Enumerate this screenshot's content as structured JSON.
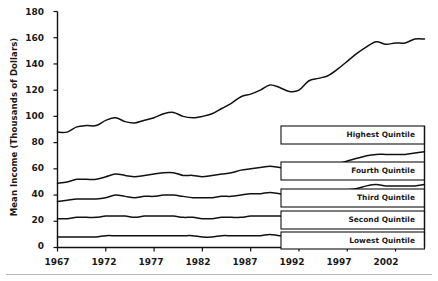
{
  "chart_data": {
    "type": "line",
    "title": "",
    "xlabel": "",
    "ylabel": "Mean Income (Thousands of Dollars)",
    "xlim": [
      1967,
      2005
    ],
    "ylim": [
      0,
      180
    ],
    "yticks": [
      0,
      20,
      40,
      60,
      80,
      100,
      120,
      140,
      160,
      180
    ],
    "xticks": [
      1967,
      1972,
      1977,
      1982,
      1987,
      1992,
      1997,
      2002
    ],
    "grid": false,
    "legend_position": "inline-right",
    "x": [
      1967,
      1968,
      1969,
      1970,
      1971,
      1972,
      1973,
      1974,
      1975,
      1976,
      1977,
      1978,
      1979,
      1980,
      1981,
      1982,
      1983,
      1984,
      1985,
      1986,
      1987,
      1988,
      1989,
      1990,
      1991,
      1992,
      1993,
      1994,
      1995,
      1996,
      1997,
      1998,
      1999,
      2000,
      2001,
      2002,
      2003,
      2004,
      2005
    ],
    "series": [
      {
        "name": "Highest Quintile",
        "label": "Highest Quintile",
        "color": "#111111",
        "values": [
          88,
          88,
          92,
          93,
          93,
          97,
          99,
          96,
          95,
          97,
          99,
          102,
          103,
          100,
          99,
          100,
          102,
          106,
          110,
          115,
          117,
          120,
          124,
          122,
          119,
          120,
          127,
          129,
          131,
          136,
          142,
          148,
          153,
          157,
          155,
          156,
          156,
          159,
          159
        ]
      },
      {
        "name": "Fourth Quintile",
        "label": "Fourth Quintile",
        "color": "#111111",
        "values": [
          49,
          50,
          52,
          52,
          52,
          54,
          56,
          55,
          54,
          55,
          56,
          57,
          57,
          55,
          55,
          54,
          55,
          56,
          57,
          59,
          60,
          61,
          62,
          61,
          60,
          60,
          60,
          62,
          63,
          64,
          66,
          68,
          70,
          71,
          71,
          71,
          71,
          72,
          73
        ]
      },
      {
        "name": "Third Quintile",
        "label": "Third Quintile",
        "color": "#111111",
        "values": [
          35,
          36,
          37,
          37,
          37,
          38,
          40,
          39,
          38,
          39,
          39,
          40,
          40,
          39,
          38,
          38,
          38,
          39,
          39,
          40,
          41,
          41,
          42,
          41,
          40,
          40,
          40,
          41,
          42,
          43,
          44,
          45,
          47,
          48,
          47,
          47,
          47,
          47,
          48
        ]
      },
      {
        "name": "Second Quintile",
        "label": "Second Quintile",
        "color": "#111111",
        "values": [
          22,
          22,
          23,
          23,
          23,
          24,
          24,
          24,
          23,
          24,
          24,
          24,
          24,
          23,
          23,
          22,
          22,
          23,
          23,
          23,
          24,
          24,
          24,
          24,
          23,
          23,
          23,
          23,
          24,
          24,
          25,
          26,
          27,
          27,
          27,
          27,
          27,
          27,
          27
        ]
      },
      {
        "name": "Lowest Quintile",
        "label": "Lowest Quintile",
        "color": "#111111",
        "values": [
          8,
          8,
          8,
          8,
          8,
          9,
          9,
          9,
          9,
          9,
          9,
          9,
          9,
          9,
          9,
          8,
          8,
          9,
          9,
          9,
          9,
          9,
          10,
          9,
          9,
          9,
          9,
          9,
          10,
          10,
          10,
          11,
          11,
          11,
          11,
          11,
          11,
          11,
          11
        ]
      }
    ]
  }
}
